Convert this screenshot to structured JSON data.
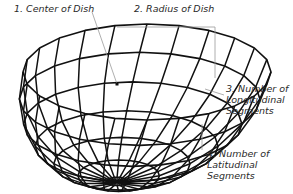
{
  "diagram": {
    "colors": {
      "wire": "#111111",
      "leader": "#9a9a9a",
      "text": "#2a2a2a",
      "background": "#ffffff"
    },
    "labels": [
      {
        "id": "center",
        "lines": [
          "1. Center of Dish"
        ]
      },
      {
        "id": "radius",
        "lines": [
          "2. Radius of Dish"
        ]
      },
      {
        "id": "longitudinal",
        "lines": [
          "3. Number of",
          "Longitudinal",
          "Segments"
        ]
      },
      {
        "id": "latitudinal",
        "lines": [
          "4. Number of",
          "Latitudinal",
          "Segments"
        ]
      }
    ]
  }
}
